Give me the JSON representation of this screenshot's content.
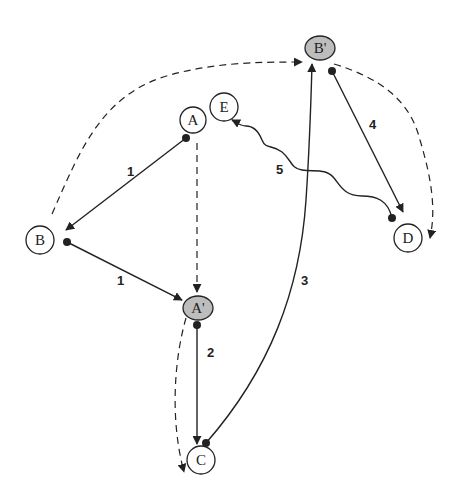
{
  "diagram": {
    "colors": {
      "stroke": "#222222",
      "node_fill": "#ffffff",
      "highlight_fill": "#bdbdbd",
      "background": "#ffffff"
    },
    "nodes": [
      {
        "id": "A",
        "label": "A",
        "shape": "circle",
        "highlighted": false
      },
      {
        "id": "E",
        "label": "E",
        "shape": "circle",
        "highlighted": false
      },
      {
        "id": "Bp",
        "label": "B'",
        "shape": "ellipse",
        "highlighted": true
      },
      {
        "id": "B",
        "label": "B",
        "shape": "circle",
        "highlighted": false
      },
      {
        "id": "Ap",
        "label": "A'",
        "shape": "ellipse",
        "highlighted": true
      },
      {
        "id": "C",
        "label": "C",
        "shape": "circle",
        "highlighted": false
      },
      {
        "id": "D",
        "label": "D",
        "shape": "circle",
        "highlighted": false
      }
    ],
    "edges": [
      {
        "from": "A",
        "to": "B",
        "style": "solid",
        "label": "1"
      },
      {
        "from": "B",
        "to": "A'",
        "style": "solid",
        "label": "1"
      },
      {
        "from": "A'",
        "to": "C",
        "style": "solid",
        "label": "2"
      },
      {
        "from": "C",
        "to": "B'",
        "style": "solid-curve",
        "label": "3"
      },
      {
        "from": "B'",
        "to": "D",
        "style": "solid",
        "label": "4"
      },
      {
        "from": "D",
        "to": "E",
        "style": "wavy",
        "label": "5"
      },
      {
        "from": "A",
        "to": "A'",
        "style": "dashed",
        "label": ""
      },
      {
        "from": "B",
        "to": "B'",
        "style": "dashed-curve",
        "label": ""
      },
      {
        "from": "B'",
        "to": "D",
        "style": "dashed-curve",
        "label": ""
      },
      {
        "from": "A'",
        "to": "C",
        "style": "dashed-curve",
        "label": ""
      }
    ],
    "edge_labels": {
      "ab": "1",
      "bap": "1",
      "apc": "2",
      "cbp": "3",
      "bpd": "4",
      "de": "5"
    }
  }
}
